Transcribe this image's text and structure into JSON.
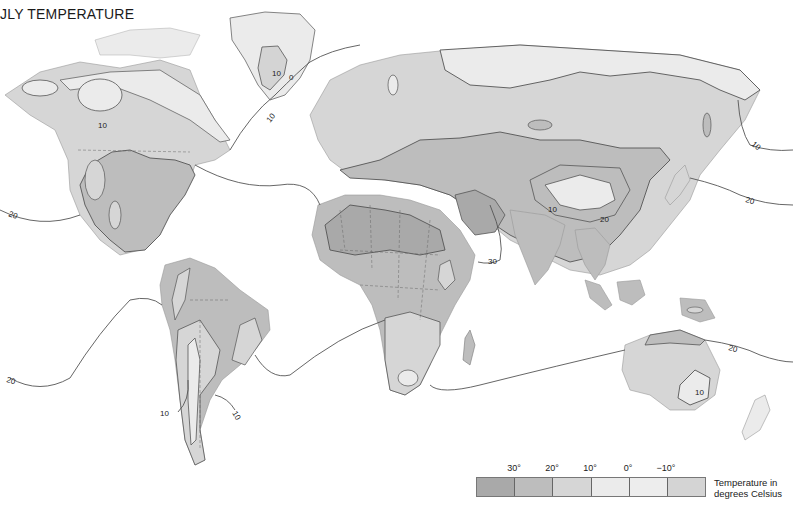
{
  "title": "JLY TEMPERATURE",
  "legend": {
    "ticks": [
      "30°",
      "20°",
      "10°",
      "0°",
      "−10°"
    ],
    "bands": [
      {
        "label": "above 30°",
        "color": "#a9a9a9"
      },
      {
        "label": "20° to 30°",
        "color": "#bdbdbd"
      },
      {
        "label": "10° to 20°",
        "color": "#d6d6d6"
      },
      {
        "label": "0° to 10°",
        "color": "#ebebeb"
      },
      {
        "label": "-10° to 0°",
        "color": "#ededed"
      },
      {
        "label": "below -10°",
        "color": "#d4d4d4"
      }
    ],
    "caption_line1": "Temperature in",
    "caption_line2": "degrees Celsius"
  },
  "isotherm_labels": {
    "greenland_10": "10",
    "greenland_0": "0",
    "canada_10": "10",
    "atlantic_10": "10",
    "pacific_west_20": "20",
    "pacific_east_10": "10",
    "pacific_east_20": "20",
    "tibet_10": "10",
    "china_20": "20",
    "arabia_30": "30",
    "south_pacific_20": "20",
    "andes_10": "10",
    "argentina_10": "10",
    "australia_20": "20",
    "australia_10": "10"
  },
  "colors": {
    "hot": "#a9a9a9",
    "warm": "#bdbdbd",
    "mild": "#d6d6d6",
    "cool": "#ebebeb",
    "water": "#ffffff",
    "line": "#555555"
  }
}
